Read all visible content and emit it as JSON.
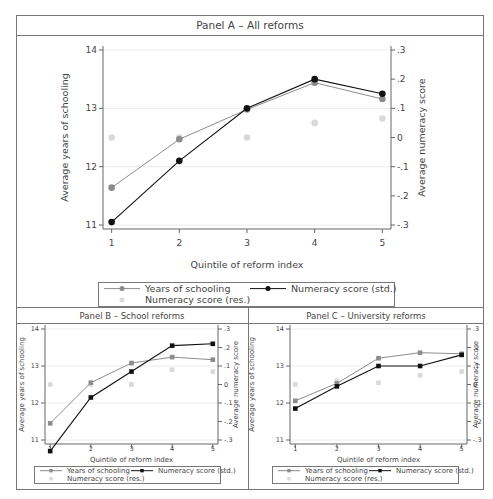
{
  "chart_data": [
    {
      "id": "A",
      "type": "line",
      "title": "Panel A – All reforms",
      "xlabel": "Quintile of reform index",
      "ylabel": "Average years of schooling",
      "y2label": "Average numeracy score",
      "x": [
        1,
        2,
        3,
        4,
        5
      ],
      "xticks": [
        "1",
        "2",
        "3",
        "4",
        "5"
      ],
      "ylim": [
        11,
        14
      ],
      "yticks": [
        "11",
        "12",
        "13",
        "14"
      ],
      "y2lim": [
        -0.3,
        0.3
      ],
      "y2ticks": [
        "-.3",
        "-.2",
        "-.1",
        "0",
        ".1",
        ".2",
        ".3"
      ],
      "grid": true,
      "legend_position": "bottom",
      "series": [
        {
          "name": "Years of schooling",
          "axis": "left",
          "color": "#8c8c8c",
          "values": [
            11.64,
            12.47,
            12.98,
            13.44,
            13.16
          ]
        },
        {
          "name": "Numeracy score (std.)",
          "axis": "right",
          "color": "#111111",
          "values": [
            -0.29,
            -0.08,
            0.1,
            0.2,
            0.15
          ]
        },
        {
          "name": "Numeracy score (res.)",
          "axis": "right",
          "color": "#d9d9d9",
          "values": [
            0.0,
            0.0,
            0.0,
            0.05,
            0.065
          ]
        }
      ]
    },
    {
      "id": "B",
      "type": "line",
      "title": "Panel B – School reforms",
      "xlabel": "Quintile of reform index",
      "ylabel": "Average years of schooling",
      "y2label": "Average numeracy score",
      "x": [
        1,
        2,
        3,
        4,
        5
      ],
      "xticks": [
        "1",
        "2",
        "3",
        "4",
        "5"
      ],
      "ylim": [
        11,
        14
      ],
      "yticks": [
        "11",
        "12",
        "13",
        "14"
      ],
      "y2lim": [
        -0.3,
        0.3
      ],
      "y2ticks": [
        "-.3",
        "-.2",
        "-.1",
        "0",
        ".1",
        ".2",
        ".3"
      ],
      "grid": true,
      "legend_position": "bottom",
      "series": [
        {
          "name": "Years of schooling",
          "axis": "left",
          "color": "#8c8c8c",
          "values": [
            11.45,
            12.55,
            13.08,
            13.24,
            13.17
          ]
        },
        {
          "name": "Numeracy score (std.)",
          "axis": "right",
          "color": "#111111",
          "values": [
            -0.36,
            -0.07,
            0.07,
            0.21,
            0.22
          ]
        },
        {
          "name": "Numeracy score (res.)",
          "axis": "right",
          "color": "#d9d9d9",
          "values": [
            0.0,
            0.0,
            0.0,
            0.08,
            0.07
          ]
        }
      ]
    },
    {
      "id": "C",
      "type": "line",
      "title": "Panel C – University reforms",
      "xlabel": "Quintile of reform index",
      "ylabel": "Average years of schooling",
      "y2label": "Average numeracy score",
      "x": [
        1,
        2,
        3,
        4,
        5
      ],
      "xticks": [
        "1",
        "2",
        "3",
        "4",
        "5"
      ],
      "ylim": [
        11,
        14
      ],
      "yticks": [
        "11",
        "12",
        "13",
        "14"
      ],
      "y2lim": [
        -0.3,
        0.3
      ],
      "y2ticks": [
        "-.3",
        "-.2",
        "-.1",
        "0",
        ".1",
        ".2",
        ".3"
      ],
      "grid": true,
      "legend_position": "bottom",
      "series": [
        {
          "name": "Years of schooling",
          "axis": "left",
          "color": "#8c8c8c",
          "values": [
            12.06,
            12.53,
            13.21,
            13.36,
            13.33
          ]
        },
        {
          "name": "Numeracy score (std.)",
          "axis": "right",
          "color": "#111111",
          "values": [
            -0.13,
            -0.01,
            0.1,
            0.1,
            0.16
          ]
        },
        {
          "name": "Numeracy score (res.)",
          "axis": "right",
          "color": "#d9d9d9",
          "values": [
            0.0,
            0.02,
            0.01,
            0.05,
            0.07
          ]
        }
      ]
    }
  ]
}
